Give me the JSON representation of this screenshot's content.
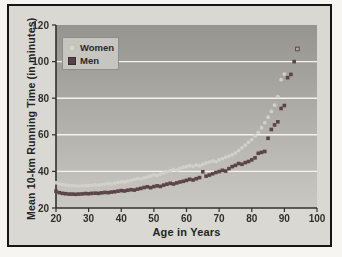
{
  "figure": {
    "x_axis_label": "Age in Years",
    "y_axis_label": "Mean 10-km Running Time (in minutes)",
    "legend": {
      "women_label": "Women",
      "men_label": "Men"
    }
  },
  "colors": {
    "women_marker": "#d3d2c8",
    "men_marker": "#5c4347",
    "plot_bg_top": "#95948f",
    "plot_bg_bottom": "#c9c8c3",
    "gridline": "#f4f3ef",
    "axis_line": "#33302c",
    "tick_text": "#33302c"
  },
  "chart_data": {
    "type": "scatter",
    "title": "",
    "xlabel": "Age in Years",
    "ylabel": "Mean 10-km Running Time (in minutes)",
    "xlim": [
      20,
      100
    ],
    "ylim": [
      20,
      120
    ],
    "x_ticks": [
      20,
      30,
      40,
      50,
      60,
      70,
      80,
      90,
      100
    ],
    "y_ticks": [
      20,
      40,
      60,
      80,
      100,
      120
    ],
    "gridlines_y": [
      40,
      60,
      80,
      100
    ],
    "grid": true,
    "legend_position": "top-left",
    "series": [
      {
        "name": "Women",
        "marker": "circle",
        "color": "#d3d2c8",
        "points": [
          [
            20,
            33.8
          ],
          [
            21,
            33.2
          ],
          [
            22,
            32.8
          ],
          [
            23,
            32.5
          ],
          [
            24,
            32.3
          ],
          [
            25,
            32.2
          ],
          [
            26,
            32.1
          ],
          [
            27,
            32.0
          ],
          [
            28,
            32.1
          ],
          [
            29,
            32.3
          ],
          [
            30,
            32.2
          ],
          [
            31,
            32.4
          ],
          [
            32,
            32.6
          ],
          [
            33,
            32.5
          ],
          [
            34,
            32.8
          ],
          [
            35,
            33.1
          ],
          [
            36,
            33.4
          ],
          [
            37,
            33.2
          ],
          [
            38,
            33.6
          ],
          [
            39,
            34.0
          ],
          [
            40,
            34.4
          ],
          [
            41,
            34.2
          ],
          [
            42,
            34.7
          ],
          [
            43,
            35.1
          ],
          [
            44,
            35.6
          ],
          [
            45,
            36.1
          ],
          [
            46,
            35.8
          ],
          [
            47,
            36.4
          ],
          [
            48,
            37.0
          ],
          [
            49,
            37.5
          ],
          [
            50,
            38.1
          ],
          [
            51,
            37.8
          ],
          [
            52,
            38.5
          ],
          [
            53,
            39.2
          ],
          [
            54,
            39.8
          ],
          [
            55,
            40.4
          ],
          [
            56,
            41.1
          ],
          [
            57,
            40.7
          ],
          [
            58,
            41.6
          ],
          [
            59,
            42.3
          ],
          [
            60,
            42.6
          ],
          [
            61,
            43.1
          ],
          [
            62,
            42.8
          ],
          [
            63,
            43.5
          ],
          [
            64,
            43.1
          ],
          [
            65,
            43.8
          ],
          [
            66,
            44.6
          ],
          [
            67,
            45.1
          ],
          [
            68,
            45.7
          ],
          [
            69,
            45.3
          ],
          [
            70,
            46.3
          ],
          [
            71,
            47.0
          ],
          [
            72,
            47.8
          ],
          [
            73,
            48.4
          ],
          [
            74,
            49.1
          ],
          [
            75,
            50.1
          ],
          [
            76,
            51.3
          ],
          [
            77,
            52.9
          ],
          [
            78,
            54.3
          ],
          [
            79,
            55.9
          ],
          [
            80,
            57.4
          ],
          [
            81,
            59.4
          ],
          [
            82,
            61.3
          ],
          [
            83,
            63.9
          ],
          [
            84,
            66.6
          ],
          [
            85,
            69.6
          ],
          [
            86,
            72.8
          ],
          [
            87,
            76.2
          ],
          [
            88,
            80.9
          ],
          [
            89,
            90.1
          ],
          [
            90,
            93.2
          ]
        ]
      },
      {
        "name": "Men",
        "marker": "square",
        "color": "#5c4347",
        "last_point_open": true,
        "points": [
          [
            20,
            29.2
          ],
          [
            21,
            28.4
          ],
          [
            22,
            28.0
          ],
          [
            23,
            27.8
          ],
          [
            24,
            27.6
          ],
          [
            25,
            27.6
          ],
          [
            26,
            27.5
          ],
          [
            27,
            27.6
          ],
          [
            28,
            27.7
          ],
          [
            29,
            27.9
          ],
          [
            30,
            27.8
          ],
          [
            31,
            28.0
          ],
          [
            32,
            28.1
          ],
          [
            33,
            28.0
          ],
          [
            34,
            28.3
          ],
          [
            35,
            28.5
          ],
          [
            36,
            28.4
          ],
          [
            37,
            28.7
          ],
          [
            38,
            28.9
          ],
          [
            39,
            29.2
          ],
          [
            40,
            29.5
          ],
          [
            41,
            29.3
          ],
          [
            42,
            29.7
          ],
          [
            43,
            30.0
          ],
          [
            44,
            29.8
          ],
          [
            45,
            30.3
          ],
          [
            46,
            30.7
          ],
          [
            47,
            31.2
          ],
          [
            48,
            31.6
          ],
          [
            49,
            31.1
          ],
          [
            50,
            31.7
          ],
          [
            51,
            32.1
          ],
          [
            52,
            31.8
          ],
          [
            53,
            32.5
          ],
          [
            54,
            33.0
          ],
          [
            55,
            33.5
          ],
          [
            56,
            33.1
          ],
          [
            57,
            33.7
          ],
          [
            58,
            34.2
          ],
          [
            59,
            34.6
          ],
          [
            60,
            35.1
          ],
          [
            61,
            35.7
          ],
          [
            62,
            35.3
          ],
          [
            63,
            36.0
          ],
          [
            64,
            36.6
          ],
          [
            65,
            39.8
          ],
          [
            66,
            37.4
          ],
          [
            67,
            38.0
          ],
          [
            68,
            38.7
          ],
          [
            69,
            39.4
          ],
          [
            70,
            39.9
          ],
          [
            71,
            40.6
          ],
          [
            72,
            40.2
          ],
          [
            73,
            41.5
          ],
          [
            74,
            42.6
          ],
          [
            75,
            43.3
          ],
          [
            76,
            44.3
          ],
          [
            77,
            43.9
          ],
          [
            78,
            44.8
          ],
          [
            79,
            45.4
          ],
          [
            80,
            46.3
          ],
          [
            81,
            47.4
          ],
          [
            82,
            49.9
          ],
          [
            83,
            50.4
          ],
          [
            84,
            50.9
          ],
          [
            85,
            58.1
          ],
          [
            86,
            62.9
          ],
          [
            87,
            65.4
          ],
          [
            88,
            67.1
          ],
          [
            89,
            74.4
          ],
          [
            90,
            76.0
          ],
          [
            91,
            91.2
          ],
          [
            92,
            93.0
          ],
          [
            93,
            100.0
          ],
          [
            94,
            106.9
          ]
        ]
      }
    ]
  }
}
